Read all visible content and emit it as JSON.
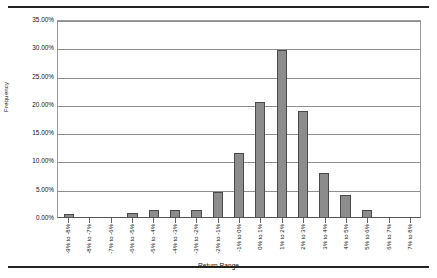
{
  "figure": {
    "bar_color": "#8c8c8c",
    "bar_edge_color": "#4a4a4a",
    "grid_color": "#8e8e8e"
  },
  "chart_data": {
    "type": "bar",
    "title": "",
    "xlabel": "Return Range",
    "ylabel": "Frequency",
    "ylim": [
      0,
      35
    ],
    "ytick_labels": [
      "35.00%",
      "30.00%",
      "25.00%",
      "20.00%",
      "15.00%",
      "10.00%",
      "5.00%",
      "0.00%"
    ],
    "ytick_values": [
      35,
      30,
      25,
      20,
      15,
      10,
      5,
      0
    ],
    "grid": true,
    "legend": "none",
    "categories": [
      "-9% to -8%",
      "-8% to -7%",
      "-7% to -6%",
      "-6% to -5%",
      "-5% to -4%",
      "-4% to -3%",
      "-3% to -2%",
      "-2% to -1%",
      "-1% to 0%",
      "0% to 1%",
      "1% to 2%",
      "2% to 3%",
      "3% to 4%",
      "4% to 5%",
      "5% to 6%",
      "6% to 7%",
      "7% to 8%"
    ],
    "values": [
      0.6,
      0,
      0,
      0.7,
      1.2,
      1.2,
      1.2,
      4.4,
      11.4,
      20.4,
      29.5,
      18.8,
      7.7,
      3.9,
      1.3,
      0,
      0
    ],
    "value_labels": [
      "0.60%",
      "0.00%",
      "0.00%",
      "0.70%",
      "1.20%",
      "1.20%",
      "1.20%",
      "4.40%",
      "11.40%",
      "20.40%",
      "29.50%",
      "18.80%",
      "7.70%",
      "3.90%",
      "1.30%",
      "0.00%",
      "0.00%"
    ]
  }
}
